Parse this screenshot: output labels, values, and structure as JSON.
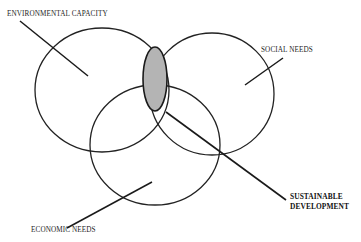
{
  "diagram": {
    "type": "venn",
    "circles": [
      {
        "id": "environmental",
        "label": "ENVIRONMENTAL CAPACITY",
        "cx": 102,
        "cy": 90,
        "rx": 67,
        "ry": 62
      },
      {
        "id": "social",
        "label": "SOCIAL NEEDS",
        "cx": 212,
        "cy": 94,
        "rx": 62,
        "ry": 61
      },
      {
        "id": "economic",
        "label": "ECONOMIC NEEDS",
        "cx": 155,
        "cy": 145,
        "rx": 65,
        "ry": 60
      }
    ],
    "intersection": {
      "label_line1": "SUSTAINABLE",
      "label_line2": "DEVELOPMENT",
      "fill": "#b4b4b4",
      "cx": 155,
      "cy": 79,
      "rx": 12,
      "ry": 32
    },
    "stroke_color": "#222222",
    "background": "#ffffff"
  },
  "labels": {
    "environmental": "ENVIRONMENTAL CAPACITY",
    "social": "SOCIAL NEEDS",
    "economic": "ECONOMIC NEEDS",
    "sustainable_line1": "SUSTAINABLE",
    "sustainable_line2": "DEVELOPMENT"
  }
}
